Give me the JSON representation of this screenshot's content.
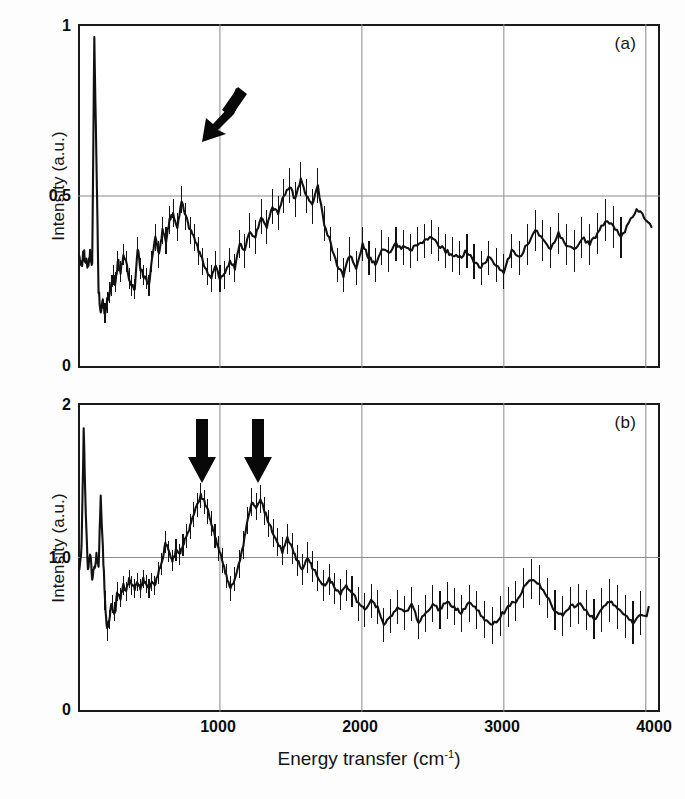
{
  "figure": {
    "xaxis_label_main": "Energy transfer (cm",
    "xaxis_label_sup": "-1",
    "xaxis_label_tail": ")",
    "xaxis_label_full": "Energy transfer (cm-1)"
  },
  "panel_a": {
    "tag": "(a)",
    "ylabel": "Intensity (a.u.)",
    "yticks": [
      "1",
      "0.5",
      "0"
    ],
    "arrow_name": "diagonal-arrow-down-left"
  },
  "panel_b": {
    "tag": "(b)",
    "ylabel": "Intensity (a.u.)",
    "yticks": [
      "2",
      "1.0",
      "0"
    ],
    "arrow1_name": "down-arrow-900",
    "arrow2_name": "down-arrow-1250"
  },
  "xticks": [
    "1000",
    "2000",
    "3000",
    "4000"
  ],
  "colors": {
    "trace": "#111111",
    "frame": "#1a1a1a",
    "gridline": "#8a8a8a",
    "background": "#ffffff",
    "arrow": "#080808"
  },
  "chart_data": [
    {
      "type": "line",
      "id": "panel-a",
      "title": "(a)",
      "xlabel": "Energy transfer (cm-1)",
      "ylabel": "Intensity (a.u.)",
      "xlim": [
        0,
        4100
      ],
      "ylim": [
        0,
        1.0
      ],
      "xticks": [
        1000,
        2000,
        3000,
        4000
      ],
      "yticks": [
        0,
        0.5,
        1
      ],
      "grid": "vertical gridlines at 1000,2000,3000; horizontal gridline at 0.5",
      "legend": "none",
      "error_bars": "vertical, symmetric, per-point",
      "annotations": [
        {
          "type": "arrow",
          "direction": "down-left",
          "x": 230,
          "y": 0.78,
          "note": "points at elastic/low-energy peak near 130 cm-1"
        }
      ],
      "x": [
        10,
        25,
        40,
        55,
        70,
        85,
        100,
        115,
        130,
        145,
        160,
        175,
        190,
        205,
        220,
        235,
        250,
        265,
        280,
        300,
        320,
        340,
        360,
        380,
        400,
        420,
        440,
        460,
        480,
        500,
        520,
        545,
        570,
        595,
        620,
        645,
        670,
        700,
        730,
        760,
        790,
        820,
        850,
        880,
        910,
        940,
        970,
        1000,
        1035,
        1070,
        1105,
        1140,
        1175,
        1210,
        1250,
        1290,
        1330,
        1370,
        1410,
        1450,
        1490,
        1530,
        1570,
        1610,
        1650,
        1690,
        1735,
        1780,
        1825,
        1870,
        1915,
        1960,
        2005,
        2050,
        2095,
        2140,
        2190,
        2240,
        2290,
        2340,
        2390,
        2440,
        2490,
        2540,
        2590,
        2640,
        2690,
        2740,
        2790,
        2840,
        2890,
        2945,
        3000,
        3055,
        3110,
        3165,
        3220,
        3275,
        3330,
        3385,
        3440,
        3495,
        3550,
        3605,
        3660,
        3715,
        3770,
        3825,
        3880,
        3935,
        3990,
        4040
      ],
      "y": [
        0.33,
        0.3,
        0.34,
        0.31,
        0.29,
        0.33,
        0.3,
        0.96,
        0.6,
        0.22,
        0.17,
        0.2,
        0.16,
        0.19,
        0.22,
        0.24,
        0.27,
        0.25,
        0.31,
        0.28,
        0.33,
        0.31,
        0.26,
        0.24,
        0.23,
        0.35,
        0.29,
        0.27,
        0.26,
        0.24,
        0.31,
        0.38,
        0.33,
        0.4,
        0.37,
        0.43,
        0.45,
        0.41,
        0.49,
        0.44,
        0.4,
        0.38,
        0.34,
        0.31,
        0.28,
        0.26,
        0.3,
        0.26,
        0.27,
        0.31,
        0.29,
        0.36,
        0.34,
        0.4,
        0.38,
        0.44,
        0.41,
        0.47,
        0.45,
        0.5,
        0.53,
        0.49,
        0.55,
        0.5,
        0.47,
        0.53,
        0.42,
        0.36,
        0.3,
        0.27,
        0.33,
        0.29,
        0.36,
        0.32,
        0.3,
        0.35,
        0.33,
        0.36,
        0.35,
        0.34,
        0.36,
        0.37,
        0.38,
        0.36,
        0.34,
        0.33,
        0.32,
        0.34,
        0.31,
        0.29,
        0.32,
        0.3,
        0.28,
        0.34,
        0.32,
        0.36,
        0.4,
        0.37,
        0.35,
        0.39,
        0.36,
        0.34,
        0.38,
        0.36,
        0.39,
        0.43,
        0.41,
        0.38,
        0.42,
        0.46,
        0.44,
        0.41
      ],
      "yerr": [
        0.03,
        0.03,
        0.03,
        0.03,
        0.03,
        0.03,
        0.03,
        0.03,
        0.04,
        0.03,
        0.03,
        0.03,
        0.03,
        0.03,
        0.03,
        0.03,
        0.03,
        0.03,
        0.03,
        0.03,
        0.03,
        0.03,
        0.03,
        0.03,
        0.03,
        0.03,
        0.03,
        0.03,
        0.03,
        0.03,
        0.03,
        0.04,
        0.04,
        0.04,
        0.04,
        0.04,
        0.04,
        0.04,
        0.04,
        0.04,
        0.04,
        0.04,
        0.04,
        0.04,
        0.04,
        0.04,
        0.04,
        0.04,
        0.04,
        0.04,
        0.04,
        0.04,
        0.05,
        0.05,
        0.05,
        0.05,
        0.05,
        0.05,
        0.05,
        0.05,
        0.05,
        0.05,
        0.05,
        0.05,
        0.05,
        0.05,
        0.05,
        0.05,
        0.05,
        0.05,
        0.05,
        0.05,
        0.05,
        0.05,
        0.05,
        0.05,
        0.05,
        0.05,
        0.05,
        0.05,
        0.05,
        0.05,
        0.05,
        0.05,
        0.05,
        0.05,
        0.05,
        0.05,
        0.05,
        0.05,
        0.05,
        0.05,
        0.05,
        0.05,
        0.05,
        0.06,
        0.06,
        0.06,
        0.06,
        0.06,
        0.06,
        0.06,
        0.06,
        0.06,
        0.06,
        0.06,
        0.06,
        0.06
      ]
    },
    {
      "type": "line",
      "id": "panel-b",
      "title": "(b)",
      "xlabel": "Energy transfer (cm-1)",
      "ylabel": "Intensity (a.u.)",
      "xlim": [
        0,
        4100
      ],
      "ylim": [
        0,
        2.0
      ],
      "xticks": [
        1000,
        2000,
        3000,
        4000
      ],
      "yticks": [
        0,
        1.0,
        2
      ],
      "grid": "vertical gridlines at 1000,2000,3000; horizontal gridline at 1.0",
      "legend": "none",
      "error_bars": "vertical, symmetric, per-point",
      "annotations": [
        {
          "type": "arrow",
          "direction": "down",
          "x": 880,
          "y": 1.72,
          "note": "marks broad peak near 900 cm-1"
        },
        {
          "type": "arrow",
          "direction": "down",
          "x": 1270,
          "y": 1.72,
          "note": "marks broad peak near 1270 cm-1"
        }
      ],
      "x": [
        10,
        25,
        40,
        55,
        70,
        85,
        100,
        115,
        130,
        145,
        160,
        175,
        190,
        205,
        220,
        240,
        260,
        280,
        300,
        320,
        340,
        360,
        380,
        400,
        420,
        440,
        460,
        480,
        500,
        520,
        540,
        565,
        590,
        615,
        640,
        665,
        690,
        715,
        740,
        765,
        790,
        815,
        840,
        865,
        890,
        915,
        940,
        965,
        990,
        1015,
        1045,
        1075,
        1105,
        1135,
        1165,
        1195,
        1225,
        1255,
        1285,
        1315,
        1345,
        1375,
        1405,
        1440,
        1475,
        1510,
        1545,
        1580,
        1615,
        1650,
        1690,
        1730,
        1770,
        1810,
        1850,
        1890,
        1930,
        1975,
        2020,
        2065,
        2110,
        2155,
        2200,
        2250,
        2300,
        2350,
        2400,
        2450,
        2500,
        2550,
        2600,
        2650,
        2700,
        2755,
        2810,
        2865,
        2920,
        2975,
        3030,
        3085,
        3140,
        3195,
        3250,
        3305,
        3360,
        3415,
        3470,
        3525,
        3580,
        3635,
        3690,
        3745,
        3800,
        3855,
        3910,
        3965,
        4020
      ],
      "y": [
        0.95,
        1.05,
        1.83,
        1.3,
        0.92,
        1.02,
        0.88,
        0.95,
        1.0,
        0.92,
        1.42,
        1.05,
        0.72,
        0.52,
        0.6,
        0.7,
        0.65,
        0.78,
        0.74,
        0.82,
        0.78,
        0.86,
        0.82,
        0.8,
        0.84,
        0.8,
        0.86,
        0.83,
        0.8,
        0.84,
        0.82,
        0.9,
        0.96,
        1.1,
        1.04,
        0.98,
        1.05,
        1.02,
        1.08,
        1.14,
        1.2,
        1.28,
        1.34,
        1.4,
        1.36,
        1.3,
        1.22,
        1.14,
        1.06,
        0.98,
        0.88,
        0.8,
        0.86,
        0.96,
        1.08,
        1.24,
        1.36,
        1.33,
        1.38,
        1.3,
        1.22,
        1.16,
        1.1,
        1.04,
        1.12,
        1.06,
        0.98,
        0.92,
        1.0,
        0.94,
        0.88,
        0.82,
        0.86,
        0.8,
        0.76,
        0.82,
        0.78,
        0.7,
        0.66,
        0.72,
        0.68,
        0.56,
        0.62,
        0.68,
        0.64,
        0.7,
        0.58,
        0.64,
        0.7,
        0.66,
        0.72,
        0.68,
        0.64,
        0.7,
        0.66,
        0.6,
        0.56,
        0.62,
        0.68,
        0.72,
        0.8,
        0.86,
        0.82,
        0.74,
        0.66,
        0.62,
        0.68,
        0.7,
        0.66,
        0.6,
        0.66,
        0.72,
        0.68,
        0.62,
        0.58,
        0.64,
        0.6,
        0.68
      ],
      "yerr": [
        0.06,
        0.06,
        0.07,
        0.07,
        0.06,
        0.06,
        0.06,
        0.06,
        0.06,
        0.06,
        0.07,
        0.06,
        0.06,
        0.06,
        0.06,
        0.06,
        0.06,
        0.06,
        0.06,
        0.06,
        0.06,
        0.06,
        0.06,
        0.06,
        0.06,
        0.06,
        0.06,
        0.06,
        0.06,
        0.06,
        0.06,
        0.07,
        0.07,
        0.07,
        0.07,
        0.07,
        0.07,
        0.07,
        0.07,
        0.08,
        0.08,
        0.08,
        0.08,
        0.08,
        0.08,
        0.08,
        0.08,
        0.08,
        0.08,
        0.08,
        0.08,
        0.08,
        0.08,
        0.09,
        0.09,
        0.09,
        0.09,
        0.09,
        0.09,
        0.09,
        0.09,
        0.09,
        0.09,
        0.09,
        0.1,
        0.1,
        0.1,
        0.1,
        0.1,
        0.1,
        0.1,
        0.1,
        0.1,
        0.1,
        0.1,
        0.1,
        0.1,
        0.11,
        0.11,
        0.11,
        0.11,
        0.11,
        0.11,
        0.11,
        0.11,
        0.11,
        0.11,
        0.12,
        0.12,
        0.12,
        0.12,
        0.12,
        0.12,
        0.12,
        0.12,
        0.12,
        0.12,
        0.13,
        0.13,
        0.13,
        0.13,
        0.13,
        0.13,
        0.13,
        0.13,
        0.13,
        0.13,
        0.13,
        0.13,
        0.13,
        0.14,
        0.14,
        0.14,
        0.14,
        0.14,
        0.14
      ]
    }
  ]
}
